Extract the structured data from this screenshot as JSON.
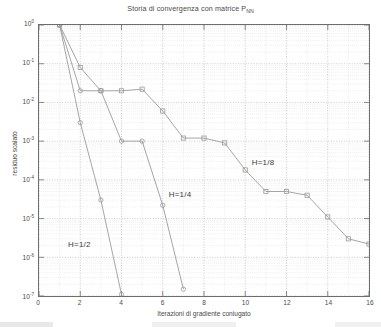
{
  "chart_data": {
    "type": "line",
    "title": "Storia di convergenza con matrice P",
    "title_subscript": "NN",
    "xlabel": "Iterazioni di gradiente coniugato",
    "ylabel": "residuo scalato",
    "xlim": [
      0,
      16
    ],
    "ylim": [
      1e-07,
      1
    ],
    "yscale": "log",
    "xscale": "linear",
    "grid": true,
    "minor_grid": true,
    "legend_position": "inline-annotations",
    "xticks": [
      "0",
      "2",
      "4",
      "6",
      "8",
      "10",
      "12",
      "14",
      "16"
    ],
    "xtick_values": [
      0,
      2,
      4,
      6,
      8,
      10,
      12,
      14,
      16
    ],
    "yticks": [
      {
        "base": "10",
        "exp": "0"
      },
      {
        "base": "10",
        "exp": "-1"
      },
      {
        "base": "10",
        "exp": "-2"
      },
      {
        "base": "10",
        "exp": "-3"
      },
      {
        "base": "10",
        "exp": "-4"
      },
      {
        "base": "10",
        "exp": "-5"
      },
      {
        "base": "10",
        "exp": "-6"
      },
      {
        "base": "10",
        "exp": "-7"
      }
    ],
    "ytick_values": [
      1.0,
      0.1,
      0.01,
      0.001,
      0.0001,
      1e-05,
      1e-06,
      1e-07
    ],
    "line_color": "#9a9a9a",
    "axis_color": "#6d6d6d",
    "grid_color": "#bfbfbf",
    "series": [
      {
        "name": "H=1/2",
        "marker": "circle",
        "label": "H=1/2",
        "label_x": 1.45,
        "label_y": 2e-06,
        "x": [
          1,
          2,
          3,
          4
        ],
        "y": [
          1.0,
          0.003,
          3e-05,
          1.1e-07
        ]
      },
      {
        "name": "H=1/4",
        "marker": "circle",
        "label": "H=1/4",
        "label_x": 6.3,
        "label_y": 4e-05,
        "x": [
          1,
          2,
          3,
          4,
          5,
          6,
          7
        ],
        "y": [
          1.0,
          0.02,
          0.02,
          0.001,
          0.001,
          2.2e-05,
          1.5e-07
        ]
      },
      {
        "name": "H=1/8",
        "marker": "square",
        "label": "H=1/8",
        "label_x": 10.3,
        "label_y": 0.00026,
        "x": [
          1,
          2,
          3,
          4,
          5,
          6,
          7,
          8,
          9,
          10,
          11,
          12,
          13,
          14,
          15,
          16
        ],
        "y": [
          1.0,
          0.08,
          0.02,
          0.02,
          0.022,
          0.006,
          0.0012,
          0.0012,
          0.0009,
          0.00018,
          5e-05,
          5e-05,
          4e-05,
          1.1e-05,
          3e-06,
          2.2e-06
        ]
      }
    ]
  }
}
